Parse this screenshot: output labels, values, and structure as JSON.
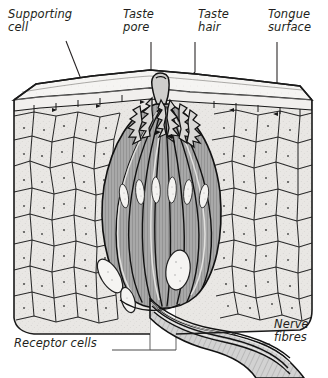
{
  "diagram": {
    "style": "grayscale line drawing with hatched/stippled tissue texture",
    "colors": {
      "ink": "#231f20",
      "line": "#1a1a1a",
      "epithelium_fill": "#e8e6e3",
      "top_face_fill": "#f4f3f1",
      "taste_bud_fill": "#a9a9a9",
      "taste_bud_shadow": "#8e8e8e",
      "nucleus_fill": "#f2f2f0",
      "nerve_fill": "#c9c9c9",
      "background": "#ffffff"
    },
    "labels": [
      {
        "id": "supporting-cell",
        "text": "Supporting\ncell",
        "line1": "Supporting",
        "line2": "cell",
        "leader": "diagonal down-right into epithelium"
      },
      {
        "id": "taste-pore",
        "text": "Taste\npore",
        "line1": "Taste",
        "line2": "pore",
        "leader": "vertical down to pore opening"
      },
      {
        "id": "taste-hair",
        "text": "Taste\nhair",
        "line1": "Taste",
        "line2": "hair",
        "leader": "down-left to microvilli tuft"
      },
      {
        "id": "tongue-surface",
        "text": "Tongue\nsurface",
        "line1": "Tongue",
        "line2": "surface",
        "leader": "vertical down to top face"
      },
      {
        "id": "receptor-cells",
        "text": "Receptor cells",
        "line1": "Receptor cells",
        "line2": "",
        "leader": "horizontal right then up into bud"
      },
      {
        "id": "nerve-fibres",
        "text": "Nerve\nfibres",
        "line1": "Nerve",
        "line2": "fibres",
        "leader": "left to nerve bundle"
      }
    ],
    "structures": [
      "tongue surface (top face of tissue block)",
      "stratified squamous epithelium with polygonal supporting cells",
      "taste pore opening at apex",
      "taste hairs (microvilli) projecting through the pore",
      "elongated receptor (gustatory) cells with oval nuclei",
      "basal cells at base of taste bud",
      "nerve fibres leaving the base toward lower right"
    ]
  }
}
